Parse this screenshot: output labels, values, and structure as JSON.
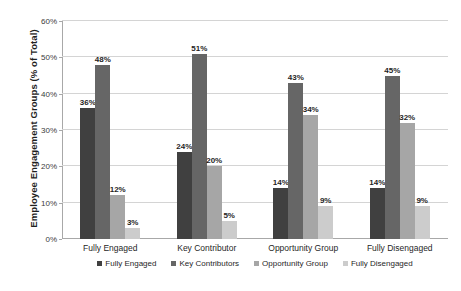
{
  "chart_data": {
    "type": "bar",
    "title": "",
    "xlabel": "",
    "ylabel": "Employee Engagement Groups (% of Total)",
    "ylim": [
      0,
      60
    ],
    "ytick_labels": [
      "0%",
      "10%",
      "20%",
      "30%",
      "40%",
      "50%",
      "60%"
    ],
    "ytick_values": [
      0,
      10,
      20,
      30,
      40,
      50,
      60
    ],
    "grid": true,
    "legend_position": "bottom",
    "categories": [
      "Fully Engaged",
      "Key Contributor",
      "Opportunity Group",
      "Fully Disengaged"
    ],
    "series": [
      {
        "name": "Fully Engaged",
        "color": "#404040",
        "values": [
          36,
          24,
          14,
          14
        ],
        "value_labels": [
          "36%",
          "24%",
          "14%",
          "14%"
        ]
      },
      {
        "name": "Key Contributors",
        "color": "#666666",
        "values": [
          48,
          51,
          43,
          45
        ],
        "value_labels": [
          "48%",
          "51%",
          "43%",
          "45%"
        ]
      },
      {
        "name": "Opportunity Group",
        "color": "#a6a6a6",
        "values": [
          12,
          20,
          34,
          32
        ],
        "value_labels": [
          "12%",
          "20%",
          "34%",
          "32%"
        ]
      },
      {
        "name": "Fully Disengaged",
        "color": "#cccccc",
        "values": [
          3,
          5,
          9,
          9
        ],
        "value_labels": [
          "3%",
          "5%",
          "9%",
          "9%"
        ]
      }
    ]
  }
}
